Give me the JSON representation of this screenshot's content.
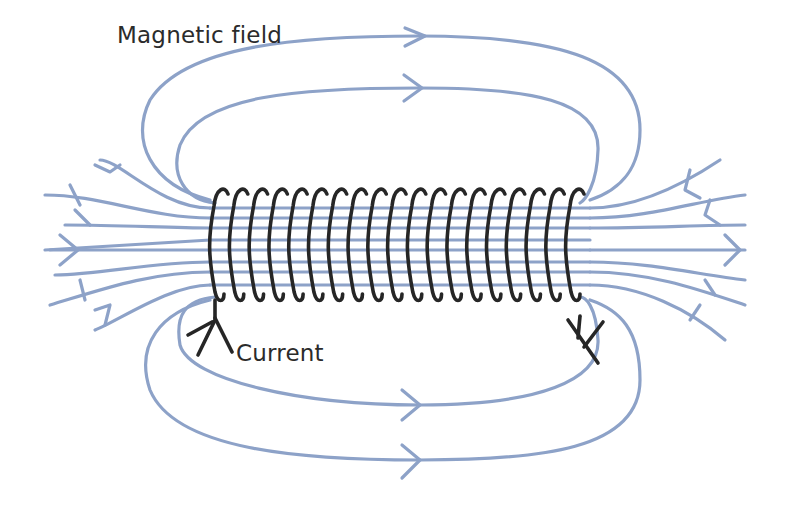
{
  "diagram": {
    "labels": {
      "field": "Magnetic field",
      "current": "Current"
    },
    "colors": {
      "field_lines": "#8da2c8",
      "coil": "#262626",
      "text": "#2b2b2b",
      "background": "#ffffff"
    },
    "coil": {
      "turns": 19,
      "x_start": 222,
      "x_end": 578,
      "y_top": 188,
      "y_bottom": 300
    },
    "internal_field_lines": 10
  }
}
